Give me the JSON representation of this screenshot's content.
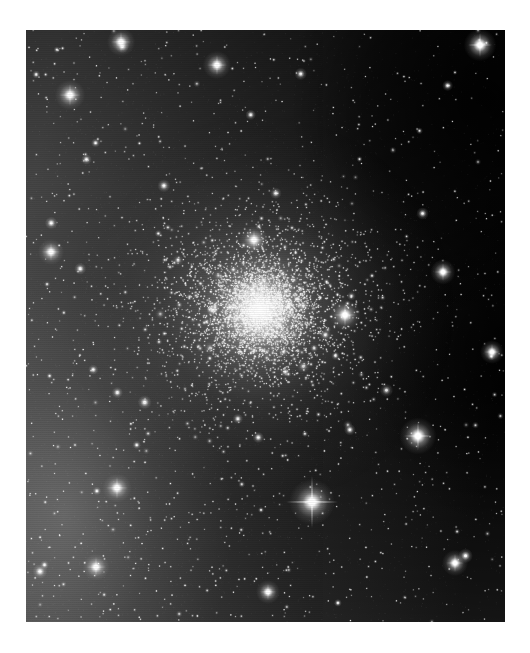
{
  "page": {
    "background_color": "#ffffff",
    "width": 530,
    "height": 653
  },
  "image": {
    "kind": "astronomical-photograph",
    "subject": "globular-star-cluster",
    "color_mode": "grayscale",
    "frame": {
      "x": 26,
      "y": 30,
      "width": 479,
      "height": 592
    },
    "background_sky": {
      "left_tone": "#4d4d4d",
      "mid_tone": "#2a2a2a",
      "right_tone": "#050505",
      "bottom_left_tone": "#585858",
      "top_right_tone": "#020202",
      "gradient_direction": "left-bright-to-right-dark"
    },
    "cluster": {
      "center_x": 260,
      "center_y": 310,
      "core_radius": 34,
      "halo_radius": 135,
      "core_color": "#ffffff",
      "halo_color": "#cfcfcf",
      "resolved_star_count": 4200,
      "core_star_count": 1500
    },
    "field_stars": {
      "count": 1700,
      "color": "#ffffff"
    },
    "bright_stars": [
      {
        "name": "bright-star-diffraction-spikes",
        "x": 312,
        "y": 502,
        "radius": 4.2,
        "spikes": true,
        "spike_length": 26
      },
      {
        "name": "bright-star-right-field",
        "x": 418,
        "y": 436,
        "radius": 3.4,
        "spikes": true,
        "spike_length": 14
      },
      {
        "name": "bright-star-upper-right",
        "x": 480,
        "y": 45,
        "radius": 3.0,
        "spikes": true,
        "spike_length": 12
      },
      {
        "name": "bright-star-upper-left",
        "x": 70,
        "y": 95,
        "radius": 2.8,
        "spikes": true,
        "spike_length": 11
      },
      {
        "name": "bright-star-top-center",
        "x": 121,
        "y": 42,
        "radius": 2.6,
        "spikes": true,
        "spike_length": 10
      },
      {
        "name": "bright-star-top-mid",
        "x": 217,
        "y": 65,
        "radius": 2.6,
        "spikes": true,
        "spike_length": 10
      },
      {
        "name": "bright-star-lower-left",
        "x": 117,
        "y": 488,
        "radius": 2.7,
        "spikes": true,
        "spike_length": 11
      },
      {
        "name": "bright-star-left-mid",
        "x": 51,
        "y": 252,
        "radius": 2.4,
        "spikes": true,
        "spike_length": 9
      },
      {
        "name": "bright-star-bottom-left",
        "x": 96,
        "y": 567,
        "radius": 2.5,
        "spikes": true,
        "spike_length": 10
      },
      {
        "name": "bright-star-right-lower",
        "x": 455,
        "y": 563,
        "radius": 2.4,
        "spikes": true,
        "spike_length": 9
      },
      {
        "name": "bright-star-right-upper",
        "x": 443,
        "y": 272,
        "radius": 2.3,
        "spikes": true,
        "spike_length": 9
      },
      {
        "name": "bright-star-cluster-edge-east",
        "x": 345,
        "y": 315,
        "radius": 2.9,
        "spikes": true,
        "spike_length": 12
      },
      {
        "name": "bright-star-cluster-north",
        "x": 254,
        "y": 240,
        "radius": 2.6,
        "spikes": true,
        "spike_length": 10
      },
      {
        "name": "bright-star-bottom-center",
        "x": 268,
        "y": 592,
        "radius": 2.2,
        "spikes": true,
        "spike_length": 8
      },
      {
        "name": "bright-star-far-right",
        "x": 492,
        "y": 352,
        "radius": 2.2,
        "spikes": true,
        "spike_length": 8
      }
    ],
    "caption": ""
  }
}
